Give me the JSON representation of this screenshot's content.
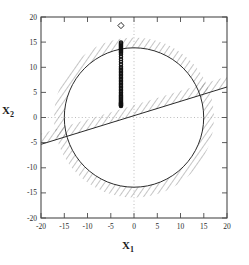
{
  "figure": {
    "background": "#ffffff",
    "frame_color": "#555555",
    "grid_color": "#aaaaaa",
    "curve_color": "#333333",
    "hatch_color": "#777777",
    "marker_color": "#111111"
  },
  "axes": {
    "x_label_name": "X",
    "x_label_sub": "1",
    "y_label_name": "X",
    "y_label_sub": "2",
    "x_ticks": [
      "-20",
      "-15",
      "-10",
      "-5",
      "0",
      "5",
      "10",
      "15",
      "20"
    ],
    "y_ticks": [
      "20",
      "15",
      "10",
      "5",
      "0",
      "-5",
      "-10",
      "-15",
      "-20"
    ]
  },
  "chart_data": {
    "type": "scatter",
    "title": "",
    "xlabel": "X_1",
    "ylabel": "X_2",
    "xlim": [
      -20,
      20
    ],
    "ylim": [
      -20,
      20
    ],
    "xticks": [
      -20,
      -15,
      -10,
      -5,
      0,
      5,
      10,
      15,
      20
    ],
    "yticks": [
      -20,
      -15,
      -10,
      -5,
      0,
      5,
      10,
      15,
      20
    ],
    "grid": "dotted zero-lines only",
    "legend": "none",
    "series": [
      {
        "name": "optimum-marker",
        "type": "scatter",
        "marker": "diamond-open",
        "x": [
          -2.8
        ],
        "y": [
          18.3
        ]
      },
      {
        "name": "sample-points",
        "type": "scatter",
        "marker": "circle-filled",
        "x": [
          -2.8,
          -2.8,
          -2.8,
          -2.8,
          -2.8,
          -2.8,
          -2.8,
          -2.8,
          -2.8,
          -2.8,
          -2.8,
          -2.8,
          -2.8,
          -2.8,
          -2.8,
          -2.8,
          -2.8,
          -2.8,
          -2.8,
          -2.8,
          -2.8,
          -2.8,
          -2.8,
          -2.8,
          -2.8,
          -2.8,
          -2.8,
          -2.8,
          -2.8,
          -2.8,
          -2.8,
          -2.8,
          -2.8,
          -2.8,
          -2.8,
          -2.8,
          -2.8,
          -2.8,
          -2.8,
          -2.8,
          -2.8,
          -2.8,
          -2.8,
          -2.8,
          -2.8,
          -2.8,
          -2.8,
          -2.8,
          -2.8,
          -2.8
        ],
        "y": [
          14.9,
          14.7,
          14.5,
          14.3,
          14.1,
          13.9,
          13.7,
          13.5,
          13.3,
          13.1,
          12.9,
          12.6,
          12.1,
          11.6,
          11.1,
          10.6,
          10.1,
          9.8,
          9.5,
          9.2,
          8.9,
          8.6,
          8.3,
          8.0,
          7.7,
          7.4,
          7.1,
          6.8,
          6.5,
          6.2,
          5.9,
          5.6,
          5.3,
          5.0,
          4.7,
          4.4,
          4.2,
          4.0,
          3.8,
          3.6,
          3.4,
          3.2,
          3.0,
          2.9,
          2.8,
          2.7,
          2.6,
          2.5,
          2.4,
          2.3
        ]
      }
    ],
    "constraints": [
      {
        "name": "circular-constraint",
        "shape": "circle",
        "center": [
          0,
          0
        ],
        "radius": 15,
        "hatch": "outside",
        "hatch_width": 2.2
      },
      {
        "name": "linear-constraint",
        "shape": "line",
        "slope": 0.32,
        "intercept": 3.2,
        "hatch": "below",
        "hatch_width": 2.2
      }
    ]
  }
}
